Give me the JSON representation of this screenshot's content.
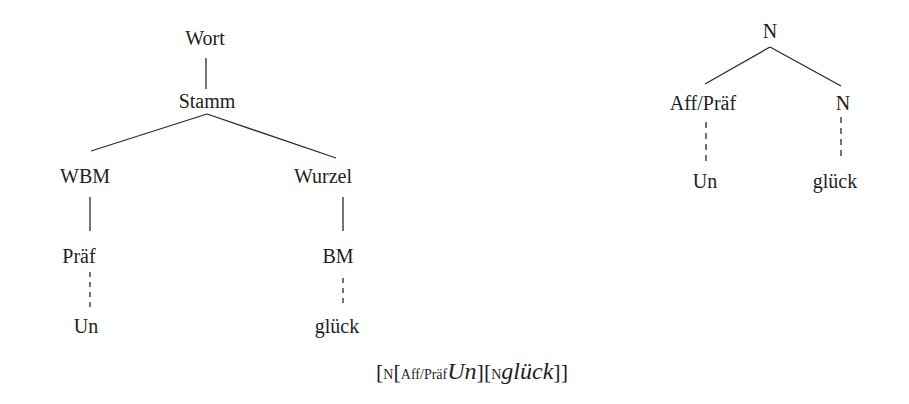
{
  "left_tree": {
    "nodes": {
      "root": "Wort",
      "stem": "Stamm",
      "left": "WBM",
      "right": "Wurzel",
      "left_child": "Präf",
      "right_child": "BM",
      "left_leaf": "Un",
      "right_leaf": "glück"
    }
  },
  "right_tree": {
    "nodes": {
      "root": "N",
      "left": "Aff/Präf",
      "right": "N",
      "left_leaf": "Un",
      "right_leaf": "glück"
    }
  },
  "bracket_notation": {
    "open1": "[",
    "label1": "N",
    "open2": "[",
    "label2": "Aff/Präf",
    "word1": "Un",
    "close2": "][",
    "label3": "N",
    "word2": "glück",
    "close_all": "]]"
  }
}
